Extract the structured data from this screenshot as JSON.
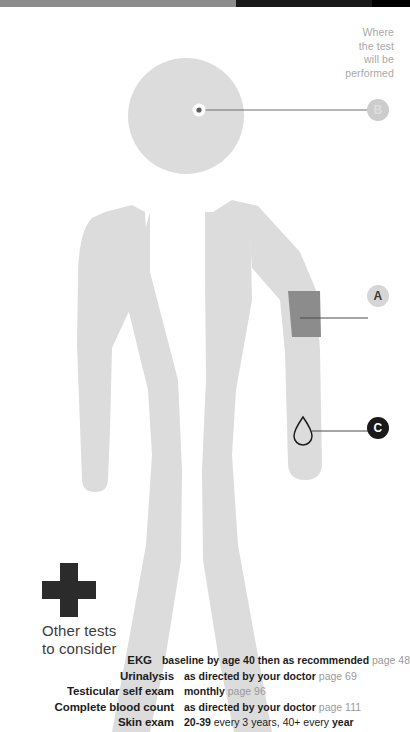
{
  "top_bar": {
    "segments": [
      {
        "name": "gray-segment",
        "color": "#8c8c8c"
      },
      {
        "name": "black-segment",
        "color": "#191919"
      },
      {
        "name": "black-segment-right",
        "color": "#000000"
      }
    ]
  },
  "diagram": {
    "body_color": "#dcdcdc",
    "cuff_color": "#8c8c8c",
    "leader_line_color": "#6e6e6e",
    "callout": {
      "where_the_test_label": "Where\nthe test\nwill be\nperformed"
    },
    "markers": [
      {
        "id": "B",
        "label": "B",
        "name": "marker-b",
        "target": "head",
        "bg": "#cccccc",
        "fg": "#dedede"
      },
      {
        "id": "A",
        "label": "A",
        "name": "marker-a",
        "target": "upper-arm-cuff",
        "bg": "#d6d6d6",
        "fg": "#3a3a3a"
      },
      {
        "id": "C",
        "label": "C",
        "name": "marker-c",
        "target": "blood-draw-drop",
        "bg": "#1a1a1a",
        "fg": "#ffffff"
      }
    ],
    "icons": {
      "blood_drop": "blood-drop-icon",
      "eye_dot": "eye-dot-icon",
      "medical_cross": "medical-cross-icon"
    }
  },
  "other_tests": {
    "heading_line1": "Other tests",
    "heading_line2": "to consider",
    "rows": [
      {
        "name": "EKG",
        "detail_parts": [
          {
            "text": "baseline by age 40 then as recommended",
            "style": "strong"
          },
          {
            "text": "page 48",
            "style": "page"
          }
        ]
      },
      {
        "name": "Urinalysis",
        "detail_parts": [
          {
            "text": "as directed by your doctor",
            "style": "strong"
          },
          {
            "text": "page 69",
            "style": "page"
          }
        ]
      },
      {
        "name": "Testicular self exam",
        "detail_parts": [
          {
            "text": "monthly",
            "style": "strong"
          },
          {
            "text": "page 96",
            "style": "page"
          }
        ]
      },
      {
        "name": "Complete blood count",
        "detail_parts": [
          {
            "text": "as directed by your doctor",
            "style": "strong"
          },
          {
            "text": "page 111",
            "style": "page"
          }
        ]
      },
      {
        "name": "Skin exam",
        "detail_parts": [
          {
            "text": "20-39",
            "style": "strong"
          },
          {
            "text": "every 3 years, 40+ every",
            "style": "normal"
          },
          {
            "text": "year",
            "style": "strong"
          }
        ]
      }
    ]
  }
}
